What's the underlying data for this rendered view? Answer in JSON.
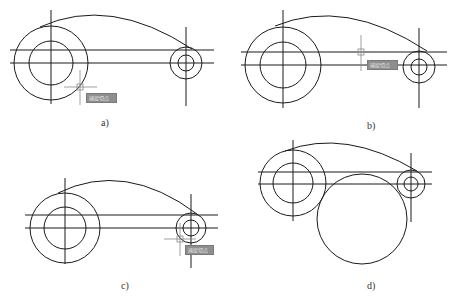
{
  "figure": {
    "top_text_clipped": "",
    "caption_clipped": "",
    "stroke_color": "#1a1a1a",
    "cursor_color": "#888888",
    "tooltip_bg": "#8e8e8e"
  },
  "panels": [
    {
      "id": "a",
      "label": "a)",
      "tooltip": "捕捉切点",
      "big_circle": {
        "cx": 51,
        "cy": 63,
        "r_outer": 37,
        "r_inner": 22
      },
      "small_circle": {
        "cx": 186,
        "cy": 63,
        "r_outer": 16,
        "r_inner": 8
      },
      "cursor": {
        "x": 80,
        "y": 86
      }
    },
    {
      "id": "b",
      "label": "b)",
      "tooltip": "捕捉切点",
      "big_circle": {
        "cx": 283,
        "cy": 65,
        "r_outer": 38,
        "r_inner": 23
      },
      "small_circle": {
        "cx": 419,
        "cy": 67,
        "r_outer": 16,
        "r_inner": 8
      },
      "cursor": {
        "x": 361,
        "y": 52
      }
    },
    {
      "id": "c",
      "label": "c)",
      "tooltip": "捕捉切点",
      "big_circle": {
        "cx": 65,
        "cy": 228,
        "r_outer": 35,
        "r_inner": 21
      },
      "small_circle": {
        "cx": 191,
        "cy": 228,
        "r_outer": 15,
        "r_inner": 8
      },
      "cursor": {
        "x": 180,
        "y": 239
      }
    },
    {
      "id": "d",
      "label": "d)",
      "big_circle": {
        "cx": 293,
        "cy": 183,
        "r_outer": 33,
        "r_inner": 20
      },
      "small_circle": {
        "cx": 411,
        "cy": 184,
        "r_outer": 14,
        "r_inner": 7
      },
      "tangent_circle": {
        "cx": 362,
        "cy": 219,
        "r": 45
      }
    }
  ]
}
